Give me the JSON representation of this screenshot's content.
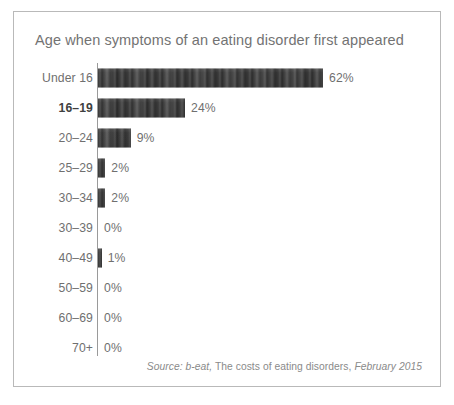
{
  "figure": {
    "title": "Age when symptoms of an eating disorder first appeared",
    "border_color": "#b9b9b9",
    "background": "#ffffff"
  },
  "source_note": {
    "prefix": "Source: b-eat,",
    "middle": " The costs of eating disorders, ",
    "suffix": "February 2015"
  },
  "chart_data": {
    "type": "bar",
    "orientation": "horizontal",
    "title": "Age when symptoms of an eating disorder first appeared",
    "xlabel": "",
    "ylabel": "",
    "categories": [
      "Under 16",
      "16–19",
      "20–24",
      "25–29",
      "30–34",
      "30–39",
      "40–49",
      "50–59",
      "60–69",
      "70+"
    ],
    "values": [
      62,
      24,
      9,
      2,
      2,
      0,
      1,
      0,
      0,
      0
    ],
    "value_labels": [
      "62%",
      "24%",
      "9%",
      "2%",
      "2%",
      "0%",
      "1%",
      "0%",
      "0%",
      "0%"
    ],
    "emphasized_categories": [
      "16–19"
    ],
    "xlim": [
      0,
      62
    ],
    "grid": false,
    "legend": false,
    "bar_color": "#3b3b3b",
    "label_color": "#6f6f6f",
    "axis_color": "#9a9a9a",
    "px_per_percent": 3.63,
    "zero_bar_min_px": 0
  }
}
